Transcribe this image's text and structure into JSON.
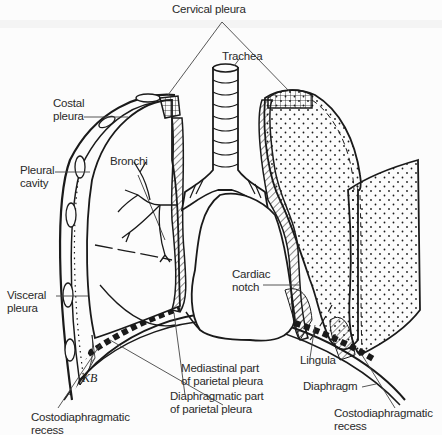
{
  "figure": {
    "signature": "KB",
    "colors": {
      "ink": "#1a1a1a",
      "paper": "#fcfcfc",
      "label": "#2a2a2a"
    }
  },
  "labels": {
    "cervical_pleura": "Cervical pleura",
    "trachea": "Trachea",
    "costal_pleura": [
      "Costal",
      "pleura"
    ],
    "pleural_cavity": [
      "Pleural",
      "cavity"
    ],
    "bronchi": "Bronchi",
    "visceral_pleura": [
      "Visceral",
      "pleura"
    ],
    "cardiac_notch": [
      "Cardiac",
      "notch"
    ],
    "mediastinal_part": [
      "Mediastinal part",
      "of parietal pleura"
    ],
    "diaphragmatic_part": [
      "Diaphragmatic part",
      "of parietal pleura"
    ],
    "lingula": "Lingula",
    "diaphragm": "Diaphragm",
    "costodiaphragmatic_recess_left": [
      "Costodiaphragmatic",
      "recess"
    ],
    "costodiaphragmatic_recess_right": [
      "Costodiaphragmatic",
      "recess"
    ]
  }
}
